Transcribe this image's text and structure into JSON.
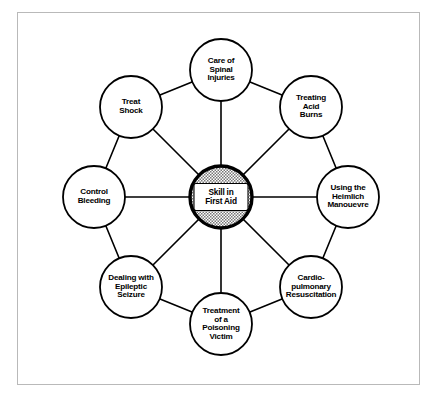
{
  "diagram": {
    "hub": {
      "label": "Skill in\nFirst Aid",
      "cx": 221,
      "cy": 197,
      "r": 31,
      "ring_fill": "#9a9a9a",
      "border_color": "#000000",
      "label_box_fill": "#ffffff"
    },
    "ring": {
      "radius": 127,
      "node_radius": 31,
      "line_color": "#000000"
    },
    "nodes": [
      {
        "id": "care-of-spinal-injuries",
        "label": "Care of\nSpinal\nInjuries",
        "angle": -90,
        "cx": 221,
        "cy": 70
      },
      {
        "id": "treating-acid-burns",
        "label": "Treating\nAcid\nBurns",
        "angle": -45,
        "cx": 311,
        "cy": 107
      },
      {
        "id": "using-the-heimlich-manouevre",
        "label": "Using the\nHeimlich\nManouevre",
        "angle": 0,
        "cx": 348,
        "cy": 197
      },
      {
        "id": "cardio-pulmonary-resuscitation",
        "label": "Cardio-\npulmonary\nResuscitation",
        "angle": 45,
        "cx": 311,
        "cy": 287
      },
      {
        "id": "treatment-of-a-poisoning-victim",
        "label": "Treatment\nof a\nPoisoning\nVictim",
        "angle": 90,
        "cx": 221,
        "cy": 324
      },
      {
        "id": "dealing-with-epileptic-seizure",
        "label": "Dealing with\nEpileptic\nSeizure",
        "angle": 135,
        "cx": 131,
        "cy": 287
      },
      {
        "id": "control-bleeding",
        "label": "Control\nBleeding",
        "angle": 180,
        "cx": 94,
        "cy": 197
      },
      {
        "id": "treat-shock",
        "label": "Treat\nShock",
        "angle": -135,
        "cx": 131,
        "cy": 107
      }
    ]
  }
}
